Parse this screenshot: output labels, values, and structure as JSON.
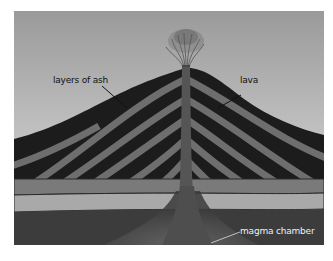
{
  "diagram": {
    "labels": [
      {
        "id": "ash",
        "text": "layers of ash"
      },
      {
        "id": "lava",
        "text": "lava"
      },
      {
        "id": "magma",
        "text": "magma chamber"
      }
    ]
  },
  "colors": {
    "sky_top": "#9a9a9a",
    "sky_bottom": "#e2e2e2",
    "dark_layer": "#1c1c1c",
    "light_layer": "#6e6e6e",
    "ground_mid": "#7a7a7a",
    "ground_light": "#a9a9a9",
    "bedrock": "#3a3a3a",
    "conduit": "#555555"
  }
}
